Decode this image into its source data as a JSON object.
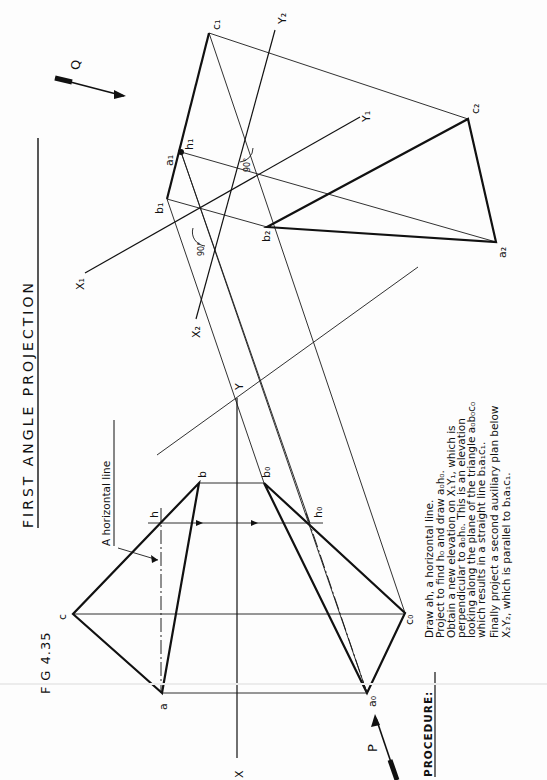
{
  "title": "FIRST ANGLE PROJECTION",
  "figure_label": "FIG 4.35",
  "annotation": "A horizontal line",
  "view_arrows": [
    {
      "label": "P"
    },
    {
      "label": "Q"
    }
  ],
  "axis_labels": {
    "x": "X",
    "y": "Y",
    "x1": "X₁",
    "y1": "Y₁",
    "x2": "X₂",
    "y2": "Y₂"
  },
  "point_labels": {
    "a": "a",
    "b": "b",
    "c": "c",
    "h": "h",
    "a0": "a₀",
    "b0": "b₀",
    "c0": "c₀",
    "h0": "h₀",
    "a1": "a₁",
    "b1": "b₁",
    "c1": "c₁",
    "h1": "h₁",
    "a2": "a₂",
    "b2": "b₂",
    "c2": "c₂"
  },
  "angle_labels": [
    "90°",
    "90°"
  ],
  "procedure": {
    "heading": "PROCEDURE:",
    "lines": [
      "Draw ah, a horizontal line.",
      "Project to find h₀ and draw a₀h₀.",
      "Obtain a new elevation on X₁Y₁, which is",
      "perpendicular to a₀h₀. This is an elevation",
      "looking along the plane of the triangle a₀b₀c₀",
      "which results in a straight line b₁a₁c₁.",
      "Finally project a second auxiliary plan below",
      "X₂Y₂, which is parallel to b₁a₁c₁."
    ]
  },
  "colors": {
    "ink": "#111111",
    "paper": "#fdfdfd"
  }
}
